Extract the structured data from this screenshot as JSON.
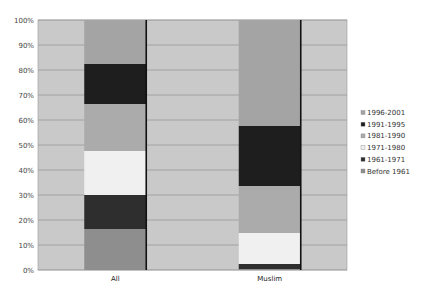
{
  "chart_data": {
    "type": "bar",
    "stacked": true,
    "percent": true,
    "title": "",
    "xlabel": "",
    "ylabel": "",
    "ylim": [
      0,
      100
    ],
    "yticks": [
      "0%",
      "10%",
      "20%",
      "30%",
      "40%",
      "50%",
      "60%",
      "70%",
      "80%",
      "90%",
      "100%"
    ],
    "grid": true,
    "legend_position": "right",
    "categories": [
      "All",
      "Muslim"
    ],
    "series": [
      {
        "name": "Before 1961",
        "color": "#8e8e8e",
        "values": [
          16.4,
          0.4
        ]
      },
      {
        "name": "1961-1971",
        "color": "#2e2e2e",
        "values": [
          13.6,
          2.0
        ]
      },
      {
        "name": "1971-1980",
        "color": "#f0f0f0",
        "values": [
          17.6,
          12.4
        ]
      },
      {
        "name": "1981-1990",
        "color": "#ababab",
        "values": [
          18.8,
          18.8
        ]
      },
      {
        "name": "1991-1995",
        "color": "#1e1e1e",
        "values": [
          16.0,
          24.0
        ]
      },
      {
        "name": "1996-2001",
        "color": "#a4a4a4",
        "values": [
          17.6,
          42.4
        ]
      }
    ],
    "legend_order": [
      "1996-2001",
      "1991-1995",
      "1981-1990",
      "1971-1980",
      "1961-1971",
      "Before 1961"
    ]
  }
}
